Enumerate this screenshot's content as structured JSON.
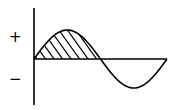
{
  "diagram": {
    "type": "sine-wave",
    "cycles": 1,
    "shaded_region": "positive half-cycle",
    "shading_style": "diagonal hatching",
    "labels": {
      "positive": "+",
      "negative": "−"
    },
    "colors": {
      "stroke": "#000000",
      "background": "#ffffff"
    }
  }
}
